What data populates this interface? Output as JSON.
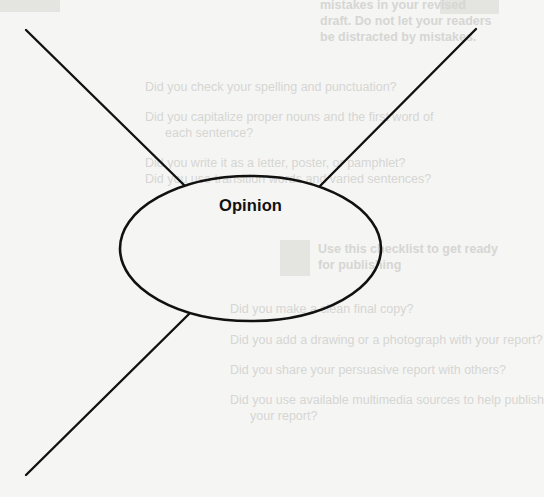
{
  "diagram": {
    "type": "web-organizer",
    "center_label": "Opinion",
    "center_shape": "ellipse",
    "branch_count": 3,
    "branches": [
      {
        "id": "top-left",
        "label": ""
      },
      {
        "id": "top-right",
        "label": ""
      },
      {
        "id": "bottom-left",
        "label": ""
      }
    ],
    "colors": {
      "ink": "#111111",
      "paper": "#f5f5f3",
      "bleed_through": "#d6d6d3"
    }
  },
  "bleed_through_text": {
    "lines": [
      "mistakes in your revised",
      "draft. Do not let your readers",
      "be distracted by mistakes.",
      "Did you check your spelling and punctuation?",
      "Did you capitalize proper nouns and the first word of",
      "each sentence?",
      "Did you write it as a letter, poster, or pamphlet?",
      "Did you use transition words and varied sentences?",
      "Use this checklist to get ready",
      "for publishing",
      "Did you make a clean final copy?",
      "Did you add a drawing or a photograph with your report?",
      "Did you share your persuasive report with others?",
      "Did you use available multimedia sources to help publish",
      "your report?"
    ]
  }
}
